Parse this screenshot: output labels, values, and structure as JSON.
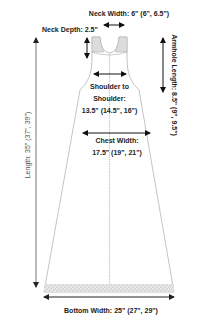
{
  "colors": {
    "outline": "#b5b5b5",
    "arrow": "#111111",
    "shading": "#d9d9d9",
    "text": "#222222",
    "length_arrow": "#777777"
  },
  "measurements": {
    "neck_width": "Neck Width: 6\" (6\", 6.5\")",
    "neck_depth": "Neck Depth: 2.5\"",
    "armhole_length": "Armhole Length: 8.5\" (9\", 9.5\")",
    "shoulder_line1": "Shoulder to",
    "shoulder_line2": "Shoulder:",
    "shoulder_line3": "13.5\" (14.5\", 16\")",
    "chest_line1": "Chest Width:",
    "chest_line2": "17.5\" (19\", 21\")",
    "length": "Length: 35\" (37\", 39\")",
    "bottom_width": "Bottom Width: 25\" (27\", 29\")"
  }
}
